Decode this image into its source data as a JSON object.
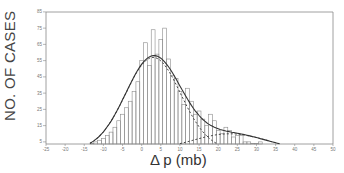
{
  "chart_data": {
    "type": "bar",
    "title": "",
    "xlabel": "Δ p (mb)",
    "ylabel": "NO. OF CASES",
    "xlim": [
      -25,
      50
    ],
    "ylim": [
      0,
      85
    ],
    "x_ticks": [
      -25,
      -20,
      -15,
      -10,
      -5,
      0,
      5,
      10,
      15,
      20,
      25,
      30,
      35,
      40,
      45,
      50
    ],
    "y_ticks": [
      5,
      15,
      25,
      35,
      45,
      55,
      65,
      75,
      85
    ],
    "grid": false,
    "legend": null,
    "bin_width": 1,
    "values_note": "Approximate. Peak bars (about 66, 74, 68, 75), the fitted-curve maximum (about 59) and the low right tail (1-5) were read from zoomed views; intermediate bin heights are interpolated along the fitted curve, not measured individually.",
    "bins": {
      "x": [
        -20,
        -19,
        -18,
        -17,
        -16,
        -15,
        -14,
        -13,
        -12,
        -11,
        -10,
        -9,
        -8,
        -7,
        -6,
        -5,
        -4,
        -3,
        -2,
        -1,
        0,
        1,
        2,
        3,
        4,
        5,
        6,
        7,
        8,
        9,
        10,
        11,
        12,
        13,
        14,
        15,
        16,
        17,
        18,
        19,
        20,
        21,
        22,
        23,
        24,
        25,
        26,
        27,
        28,
        29,
        30,
        31,
        32,
        33,
        34,
        35,
        36,
        37,
        38,
        39,
        40,
        41,
        42,
        43,
        44,
        45,
        46,
        47,
        48,
        49
      ],
      "values": [
        1,
        2,
        2,
        2,
        3,
        3,
        2,
        4,
        5,
        6,
        7,
        9,
        11,
        14,
        18,
        22,
        26,
        30,
        36,
        42,
        55,
        66,
        52,
        74,
        59,
        68,
        75,
        56,
        46,
        44,
        36,
        28,
        38,
        30,
        22,
        24,
        19,
        15,
        22,
        18,
        12,
        10,
        14,
        12,
        8,
        9,
        9,
        5,
        5,
        4,
        4,
        5,
        3,
        3,
        2,
        3,
        3,
        2,
        1,
        3,
        2,
        2,
        1,
        1,
        0,
        0,
        1,
        0,
        0,
        3
      ]
    },
    "series": [
      {
        "name": "Fitted curve (total)",
        "style": "solid",
        "description": "Smooth fitted curve, peaks near x≈3.5 at about 59 cases, skewed right with long tail"
      },
      {
        "name": "Component 1 (dashed)",
        "style": "dashed",
        "description": "Gaussian-like component, near-symmetric around x≈3, falls to ~0 by x≈22"
      },
      {
        "name": "Component 2 (dashed)",
        "style": "dashed",
        "description": "Low broad component centered near x≈23 with peak ~10 cases"
      }
    ]
  },
  "axes": {
    "ylabel": "NO. OF CASES",
    "xlabel": "Δ p (mb)"
  }
}
